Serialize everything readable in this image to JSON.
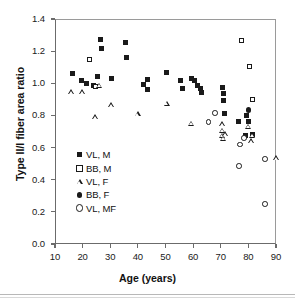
{
  "chart_data": {
    "type": "scatter",
    "title": "",
    "xlabel": "Age (years)",
    "ylabel": "Type II/I fiber area ratio",
    "xlim": [
      10,
      90
    ],
    "ylim": [
      0.0,
      1.4
    ],
    "xticks": [
      10,
      20,
      30,
      40,
      50,
      60,
      70,
      80,
      90
    ],
    "yticks": [
      "0.0",
      "0.2",
      "0.4",
      "0.6",
      "0.8",
      "1.0",
      "1.2",
      "1.4"
    ],
    "grid": false,
    "legend_position": "lower-left-inside",
    "series": [
      {
        "name": "VL, M",
        "marker": "filled-square",
        "points": [
          [
            16.5,
            1.06
          ],
          [
            19.5,
            1.015
          ],
          [
            21.5,
            1.0
          ],
          [
            24.0,
            0.985
          ],
          [
            25.5,
            1.045
          ],
          [
            26.5,
            1.275
          ],
          [
            27.0,
            1.215
          ],
          [
            30.5,
            1.03
          ],
          [
            35.5,
            1.255
          ],
          [
            36.0,
            1.16
          ],
          [
            42.0,
            0.99
          ],
          [
            43.5,
            1.025
          ],
          [
            43.5,
            0.96
          ],
          [
            50.5,
            1.065
          ],
          [
            55.5,
            1.02
          ],
          [
            56.0,
            0.965
          ],
          [
            59.5,
            1.03
          ],
          [
            60.5,
            1.015
          ],
          [
            61.5,
            0.985
          ],
          [
            62.5,
            0.97
          ],
          [
            63.0,
            0.94
          ],
          [
            70.5,
            0.975
          ],
          [
            71.0,
            0.935
          ],
          [
            71.0,
            0.89
          ],
          [
            71.5,
            0.815
          ],
          [
            76.5,
            0.76
          ],
          [
            79.5,
            0.8
          ],
          [
            80.0,
            0.765
          ],
          [
            81.5,
            0.68
          ],
          [
            79.0,
            0.675
          ]
        ]
      },
      {
        "name": "BB, M",
        "marker": "open-square",
        "points": [
          [
            22.5,
            1.145
          ],
          [
            24.5,
            0.98
          ],
          [
            77.5,
            1.265
          ],
          [
            80.5,
            1.105
          ],
          [
            81.5,
            0.9
          ]
        ]
      },
      {
        "name": "VL, F",
        "marker": "open-triangle",
        "points": [
          [
            16.0,
            0.945
          ],
          [
            20.0,
            0.945
          ],
          [
            24.5,
            0.79
          ],
          [
            26.0,
            0.985
          ],
          [
            30.5,
            0.865
          ],
          [
            40.0,
            0.81
          ],
          [
            50.5,
            0.875
          ],
          [
            59.5,
            0.75
          ],
          [
            70.5,
            0.745
          ],
          [
            70.5,
            0.705
          ],
          [
            70.5,
            0.675
          ],
          [
            71.5,
            0.685
          ],
          [
            71.0,
            0.655
          ],
          [
            80.0,
            0.73
          ],
          [
            81.0,
            0.64
          ],
          [
            81.5,
            0.675
          ],
          [
            90.0,
            0.535
          ]
        ]
      },
      {
        "name": "BB, F",
        "marker": "filled-circle",
        "points": [
          [
            80.0,
            0.835
          ]
        ]
      },
      {
        "name": "VL, MF",
        "marker": "open-circle",
        "points": [
          [
            65.5,
            0.76
          ],
          [
            68.0,
            0.815
          ],
          [
            77.0,
            0.62
          ],
          [
            76.5,
            0.485
          ],
          [
            78.5,
            0.66
          ],
          [
            86.0,
            0.53
          ],
          [
            86.0,
            0.25
          ]
        ]
      }
    ],
    "legend_entries": [
      {
        "label": "VL, M",
        "marker": "filled-square"
      },
      {
        "label": "BB, M",
        "marker": "open-square"
      },
      {
        "label": "VL, F",
        "marker": "open-triangle"
      },
      {
        "label": "BB, F",
        "marker": "filled-circle"
      },
      {
        "label": "VL, MF",
        "marker": "open-circle"
      }
    ],
    "colors": {
      "marker": "#1a1a1a",
      "axis": "#6b6b6b",
      "background": "#ffffff"
    }
  }
}
